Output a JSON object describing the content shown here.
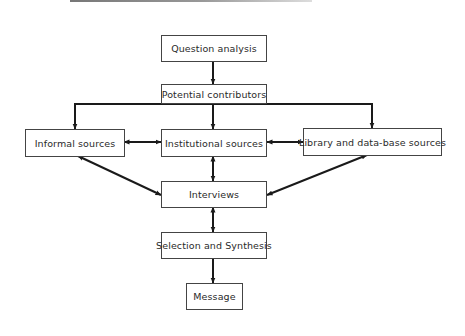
{
  "diagram": {
    "type": "flowchart",
    "nodes": {
      "question_analysis": "Question analysis",
      "potential_contributors": "Potential contributors",
      "informal_sources": "Informal sources",
      "institutional_sources": "Institutional sources",
      "library_sources": "Library and data-base sources",
      "interviews": "Interviews",
      "selection_synthesis": "Selection and Synthesis",
      "message": "Message"
    },
    "edges": [
      {
        "from": "Question analysis",
        "to": "Potential contributors",
        "direction": "one-way"
      },
      {
        "from": "Potential contributors",
        "to": "Informal sources",
        "direction": "one-way"
      },
      {
        "from": "Potential contributors",
        "to": "Institutional sources",
        "direction": "one-way"
      },
      {
        "from": "Potential contributors",
        "to": "Library and data-base sources",
        "direction": "one-way"
      },
      {
        "from": "Informal sources",
        "to": "Institutional sources",
        "direction": "two-way"
      },
      {
        "from": "Institutional sources",
        "to": "Library and data-base sources",
        "direction": "two-way"
      },
      {
        "from": "Informal sources",
        "to": "Interviews",
        "direction": "two-way"
      },
      {
        "from": "Institutional sources",
        "to": "Interviews",
        "direction": "two-way"
      },
      {
        "from": "Library and data-base sources",
        "to": "Interviews",
        "direction": "two-way"
      },
      {
        "from": "Interviews",
        "to": "Selection and Synthesis",
        "direction": "two-way"
      },
      {
        "from": "Selection and Synthesis",
        "to": "Message",
        "direction": "one-way"
      }
    ],
    "colors": {
      "line": "#1a1a1a",
      "box_border": "#444444",
      "text": "#2a2a2a"
    }
  }
}
